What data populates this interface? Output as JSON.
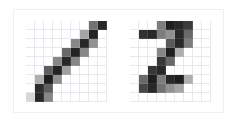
{
  "figure": {
    "title": "",
    "background_color": "#ffffff",
    "frame_color": "#f0f0f0",
    "grid_color": "#b4b4c8",
    "grid_visible": true,
    "panel_count": 2
  },
  "chart_data": {
    "type": "heatmap",
    "title": "",
    "subtitle": "",
    "xlabel": "",
    "ylabel": "",
    "colormap": "gray_reversed",
    "value_range": [
      0,
      255
    ],
    "grid": true,
    "legend": "none",
    "panels": [
      {
        "name": "digit-1",
        "label": "1",
        "rows": 9,
        "cols": 9,
        "cell_px": 9,
        "description": "handwritten digit one, diagonal stroke from lower-left to upper-right",
        "matrix": [
          [
            0,
            0,
            0,
            0,
            0,
            0,
            0,
            140,
            215
          ],
          [
            0,
            0,
            0,
            0,
            0,
            0,
            90,
            220,
            0
          ],
          [
            0,
            0,
            0,
            0,
            0,
            120,
            215,
            110,
            0
          ],
          [
            0,
            0,
            0,
            0,
            150,
            220,
            120,
            0,
            0
          ],
          [
            0,
            0,
            0,
            120,
            215,
            120,
            0,
            0,
            0
          ],
          [
            0,
            0,
            160,
            220,
            95,
            0,
            0,
            0,
            0
          ],
          [
            0,
            80,
            225,
            110,
            0,
            0,
            0,
            0,
            0
          ],
          [
            0,
            210,
            160,
            0,
            0,
            0,
            0,
            0,
            0
          ],
          [
            40,
            215,
            120,
            0,
            0,
            0,
            0,
            0,
            0
          ]
        ]
      },
      {
        "name": "digit-2",
        "label": "2",
        "rows": 9,
        "cols": 9,
        "cell_px": 9,
        "description": "handwritten digit two, curved top stroke with flat base",
        "matrix": [
          [
            0,
            0,
            0,
            130,
            225,
            215,
            195,
            0,
            0
          ],
          [
            0,
            205,
            215,
            130,
            110,
            215,
            150,
            0,
            0
          ],
          [
            0,
            0,
            0,
            0,
            165,
            215,
            130,
            0,
            0
          ],
          [
            0,
            0,
            0,
            120,
            225,
            80,
            0,
            0,
            0
          ],
          [
            0,
            0,
            0,
            200,
            150,
            0,
            0,
            0,
            0
          ],
          [
            0,
            0,
            200,
            215,
            0,
            0,
            0,
            0,
            0
          ],
          [
            0,
            150,
            225,
            130,
            215,
            225,
            80,
            0,
            0
          ],
          [
            0,
            185,
            215,
            140,
            110,
            90,
            0,
            0,
            0
          ],
          [
            0,
            0,
            0,
            0,
            0,
            0,
            0,
            0,
            0
          ]
        ]
      }
    ]
  }
}
